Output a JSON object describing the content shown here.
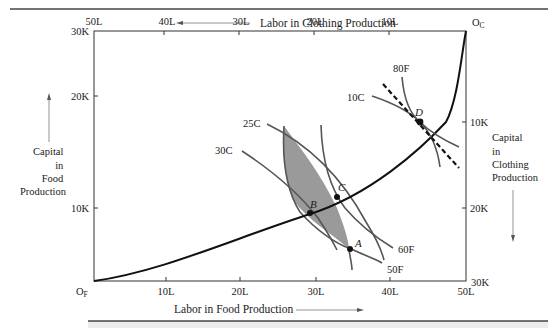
{
  "top_axis": {
    "title": "Labor in Clothing Production",
    "ticks": [
      "50L",
      "40L",
      "30L",
      "20L",
      "10L"
    ],
    "origin": "O",
    "origin_sub": "C"
  },
  "bottom_axis": {
    "title": "Labor in Food Production",
    "ticks": [
      "10L",
      "20L",
      "30L",
      "40L",
      "50L"
    ],
    "origin": "O",
    "origin_sub": "F"
  },
  "left_axis": {
    "title_lines": [
      "Capital",
      "in",
      "Food",
      "Production"
    ],
    "ticks": [
      "30K",
      "20K",
      "10K"
    ]
  },
  "right_axis": {
    "title_lines": [
      "Capital",
      "in",
      "Clothing",
      "Production"
    ],
    "ticks": [
      "10K",
      "20K",
      "30K"
    ]
  },
  "curves": {
    "food_isoquants": [
      "50F",
      "60F",
      "80F"
    ],
    "clothing_isoquants": [
      "30C",
      "25C",
      "10C"
    ]
  },
  "points": [
    "A",
    "B",
    "C",
    "D"
  ],
  "colors": {
    "line": "#1a1a1a",
    "curve": "#555555",
    "shade": "#9a9a9a",
    "rule": "#444444",
    "band": "#ececec"
  }
}
